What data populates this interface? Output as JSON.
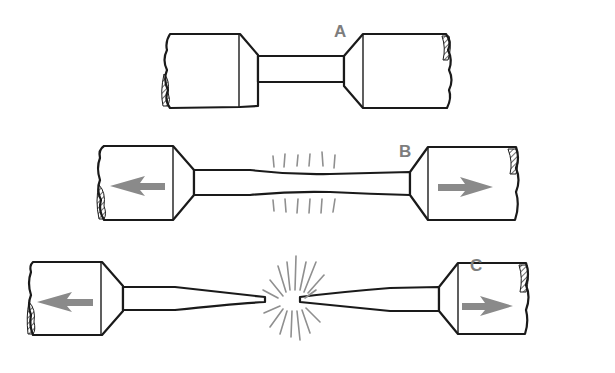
{
  "diagram": {
    "stages": [
      {
        "label": "A",
        "state": "unloaded specimen"
      },
      {
        "label": "B",
        "state": "necking under tension"
      },
      {
        "label": "C",
        "state": "fracture"
      }
    ],
    "colors": {
      "line": "#1a1a1a",
      "arrow": "#8a8a8a",
      "label": "#7d7d7d",
      "background": "#ffffff"
    }
  }
}
